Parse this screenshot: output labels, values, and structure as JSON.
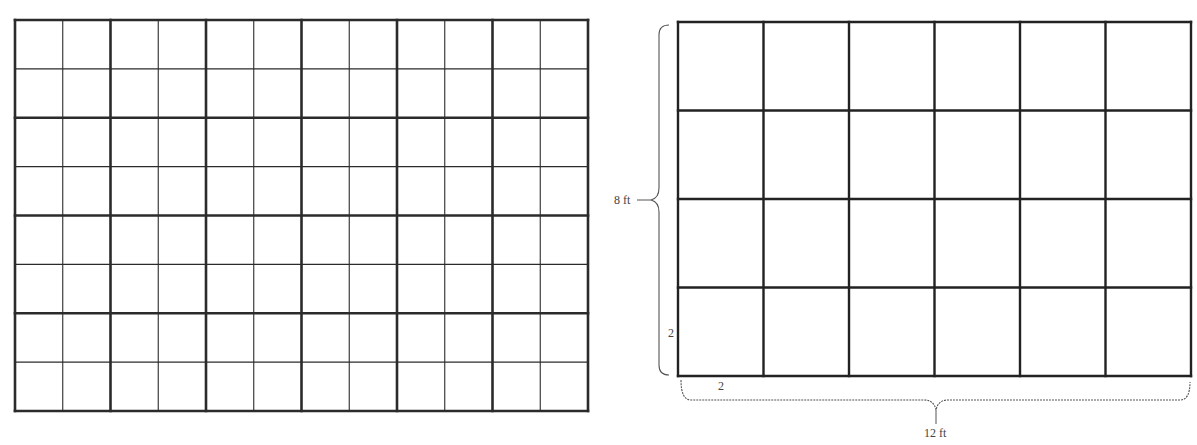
{
  "left_grid": {
    "x": 15,
    "y": 20,
    "width": 573,
    "height": 391,
    "cols": 12,
    "rows": 8,
    "major_every": 2,
    "major_stroke": 2.6,
    "minor_stroke": 1.1,
    "line_color": "#2b2b2b"
  },
  "right_grid": {
    "x": 678,
    "y": 22,
    "width": 513,
    "height": 354,
    "cols": 6,
    "rows": 4,
    "stroke": 2.4,
    "line_color": "#222222"
  },
  "labels": {
    "height_label": "8 ft",
    "width_label": "12 ft",
    "cell_height_label": "2",
    "cell_width_label": "2"
  },
  "brace_color": "#555555"
}
